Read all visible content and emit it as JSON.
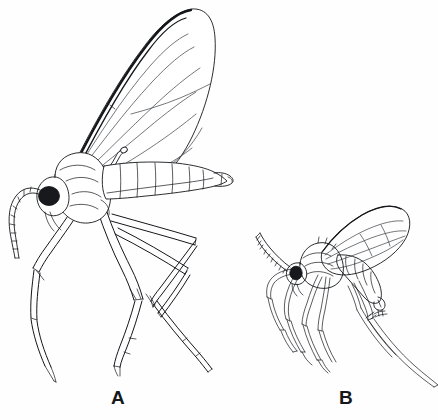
{
  "plate": {
    "kind": "scientific-line-illustration",
    "subject": "two adult flies in lateral view",
    "background_color": "#fefefe",
    "ink_color": "#14161a",
    "width": 438,
    "height": 420
  },
  "figures": [
    {
      "id": "A",
      "label": "A",
      "label_x": 118,
      "label_y": 404,
      "style": "outline line art, unshaded",
      "relative_size": "large",
      "parts": {
        "wing": "large elongate-oval wing held upright, thick dark costal margin, thin forked longitudinal veins",
        "eye": "solid black rounded eye",
        "antenna": "long segmented flagellum curving downward and forward",
        "thorax": "rounded outlined thorax",
        "abdomen": "seven-segment tapering abdomen with terminal genitalia",
        "legs": "three pairs of long slender outlined legs with knee bends, tibial spurs and tarsi"
      }
    },
    {
      "id": "B",
      "label": "B",
      "label_x": 346,
      "label_y": 404,
      "style": "stippled and shaded, tonal",
      "relative_size": "small",
      "parts": {
        "wing": "shorter stippled gray wing with darker veins, held over abdomen",
        "eye": "solid black rounded eye",
        "antenna": "thick segmented ladder-like antenna curving up and forward",
        "thorax": "humped shaded thorax with bristles",
        "abdomen": "shaded banded abdomen curving downward",
        "legs": "three pairs of slender shaded legs with knee bends and long tarsi"
      }
    }
  ],
  "labels": {
    "figure_a": "A",
    "figure_b": "B"
  }
}
